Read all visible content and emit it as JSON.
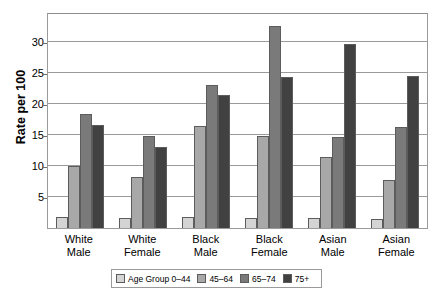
{
  "chart_data": {
    "type": "bar",
    "title": "",
    "xlabel": "",
    "ylabel": "Rate per 100",
    "ylim": [
      0,
      34.8
    ],
    "yticks": [
      5,
      10,
      15,
      20,
      25,
      30
    ],
    "grid": true,
    "legend_position": "bottom",
    "categories": [
      "White\nMale",
      "White\nFemale",
      "Black\nMale",
      "Black\nFemale",
      "Asian\nMale",
      "Asian\nFemale"
    ],
    "category_lines": [
      [
        "White",
        "Male"
      ],
      [
        "White",
        "Female"
      ],
      [
        "Black",
        "Male"
      ],
      [
        "Black",
        "Female"
      ],
      [
        "Asian",
        "Male"
      ],
      [
        "Asian",
        "Female"
      ]
    ],
    "series": [
      {
        "name": "Age Group 0–44",
        "color": "#d4d4d4",
        "values": [
          1.8,
          1.6,
          1.7,
          1.6,
          1.6,
          1.5
        ]
      },
      {
        "name": "45–64",
        "color": "#a8a8a8",
        "values": [
          10.0,
          8.2,
          16.5,
          14.8,
          11.5,
          7.8
        ]
      },
      {
        "name": "65–74",
        "color": "#7a7a7a",
        "values": [
          18.3,
          14.9,
          23.0,
          32.6,
          14.6,
          16.2
        ]
      },
      {
        "name": "75+",
        "color": "#414141",
        "values": [
          16.6,
          13.0,
          21.4,
          24.4,
          29.7,
          24.5
        ]
      }
    ]
  },
  "legend": {
    "items": [
      {
        "label": "Age Group 0–44",
        "color": "#d4d4d4"
      },
      {
        "label": "45–64",
        "color": "#a8a8a8"
      },
      {
        "label": "65–74",
        "color": "#7a7a7a"
      },
      {
        "label": "75+",
        "color": "#414141"
      }
    ]
  },
  "axis": {
    "y_title": "Rate per 100",
    "y_tick_labels": [
      "30",
      "25",
      "20",
      "15",
      "10",
      "5"
    ]
  }
}
